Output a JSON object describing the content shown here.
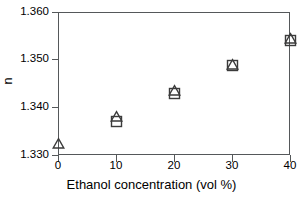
{
  "chart_data": {
    "type": "scatter",
    "title": "",
    "xlabel": "Ethanol concentration (vol %)",
    "ylabel": "n",
    "xlim": [
      0,
      40
    ],
    "ylim": [
      1.33,
      1.36
    ],
    "xticks": [
      "0",
      "10",
      "20",
      "30",
      "40"
    ],
    "xtick_values": [
      0,
      10,
      20,
      30,
      40
    ],
    "yticks": [
      "1.330",
      "1.340",
      "1.350",
      "1.360"
    ],
    "ytick_values": [
      1.33,
      1.34,
      1.35,
      1.36
    ],
    "grid": false,
    "legend": "none",
    "marker_color": "#3b3b3b",
    "axis_color": "#55585a",
    "background": "#ffffff",
    "x": [
      0,
      10,
      20,
      30,
      40
    ],
    "series": [
      {
        "name": "triangle",
        "marker": "open-triangle",
        "x": [
          0,
          10,
          20,
          30,
          40
        ],
        "values": [
          1.3325,
          1.338,
          1.3435,
          1.349,
          1.3545
        ]
      },
      {
        "name": "square",
        "marker": "open-square",
        "x": [
          10,
          20,
          30,
          40
        ],
        "values": [
          1.337,
          1.343,
          1.3487,
          1.354
        ]
      }
    ]
  }
}
